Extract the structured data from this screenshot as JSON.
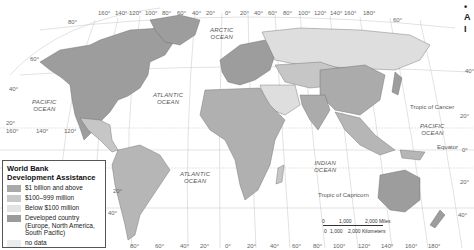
{
  "map": {
    "title_fragments_right": [
      "•",
      "A",
      "I"
    ],
    "top_longitudes": [
      "160°",
      "140°",
      "120°",
      "100°",
      "80°",
      "60°",
      "40°",
      "20°",
      "0°",
      "20°",
      "40°",
      "60°",
      "80°",
      "100°",
      "120°",
      "140°",
      "160°",
      "180°"
    ],
    "bottom_longitudes": [
      "80°",
      "60°",
      "40°",
      "20°",
      "0°",
      "20°",
      "40°",
      "60°",
      "80°",
      "100°",
      "120°",
      "140°",
      "160°",
      "180°"
    ],
    "left_longitudes": [
      "160°",
      "140°",
      "120°"
    ],
    "latitudes_left": [
      "80°",
      "60°",
      "40°",
      "20°"
    ],
    "latitudes_right": [
      "60°",
      "40°",
      "20°",
      "0°",
      "20°",
      "40°"
    ],
    "south_america_latitudes": [
      "20°",
      "40°"
    ],
    "oceans": {
      "arctic": "ARCTIC\nOCEAN",
      "atlantic_north": "ATLANTIC\nOCEAN",
      "atlantic_south": "ATLANTIC\nOCEAN",
      "pacific_west": "PACIFIC\nOCEAN",
      "pacific_east": "PACIFIC\nOCEAN",
      "indian": "INDIAN\nOCEAN"
    },
    "lines": {
      "tropic_cancer": "Tropic of Cancer",
      "tropic_capricorn": "Tropic of Capricorn",
      "equator": "Equator"
    },
    "scale": {
      "miles": [
        "0",
        "1,000",
        "2,000 Miles"
      ],
      "km": [
        "0",
        "1,000",
        "2,000 Kilometers"
      ]
    }
  },
  "legend": {
    "title_line1": "World Bank",
    "title_line2": "Development Assistance",
    "items": [
      {
        "label": "$1 billion and above",
        "color": "#a9a9a9"
      },
      {
        "label": "$100–999 million",
        "color": "#c8c8c8"
      },
      {
        "label": "Below $100 million",
        "color": "#e3e3e3"
      },
      {
        "label": "Developed country (Europe, North America, South Pacific)",
        "color": "#9b9b9b"
      },
      {
        "label": "no data",
        "color": "#ececec"
      }
    ]
  },
  "colors": {
    "developed": "#9d9d9d",
    "high": "#ababab",
    "mid": "#c6c6c6",
    "low": "#dedede",
    "nodata": "#ececec",
    "grid": "#bdbdbd",
    "border": "#555555"
  }
}
